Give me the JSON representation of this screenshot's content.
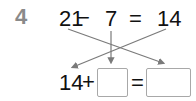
{
  "problem": {
    "number": "4",
    "top_row": {
      "minuend": "21",
      "minus": "−",
      "subtrahend": "7",
      "equals": "=",
      "difference": "14"
    },
    "bottom_row": {
      "addend": "14",
      "plus": "+",
      "blank_1": "",
      "equals": "=",
      "blank_2": ""
    }
  },
  "colors": {
    "problem_number": "#8a8a8a",
    "text": "#111111",
    "arrows": "#7a7a7a",
    "box_border": "#a8a8a8"
  }
}
